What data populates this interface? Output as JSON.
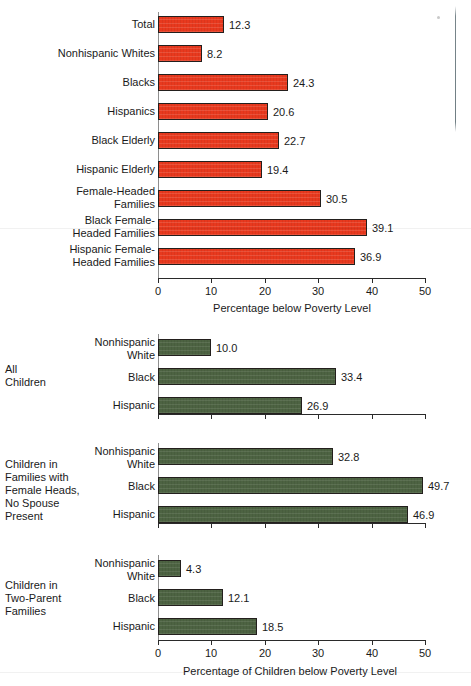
{
  "chart_data": [
    {
      "type": "bar",
      "orientation": "horizontal",
      "id": "poverty-by-group",
      "title": "",
      "xlabel": "Percentage below Poverty Level",
      "ylabel": "",
      "xlim": [
        0,
        50
      ],
      "xticks": [
        "0",
        "10",
        "20",
        "30",
        "40",
        "50"
      ],
      "grid": false,
      "legend": "none",
      "bar_color": "#e8391e",
      "categories": [
        "Total",
        "Nonhispanic Whites",
        "Blacks",
        "Hispanics",
        "Black Elderly",
        "Hispanic Elderly",
        "Female-Headed\nFamilies",
        "Black Female-\nHeaded Families",
        "Hispanic Female-\nHeaded Families"
      ],
      "values": [
        12.3,
        8.2,
        24.3,
        20.6,
        22.7,
        19.4,
        30.5,
        39.1,
        36.9
      ],
      "value_labels": [
        "12.3",
        "8.2",
        "24.3",
        "20.6",
        "22.7",
        "19.4",
        "30.5",
        "39.1",
        "36.9"
      ]
    },
    {
      "type": "bar",
      "orientation": "horizontal",
      "id": "children-poverty-by-family-type",
      "title": "",
      "xlabel": "Percentage of Children below Poverty Level",
      "ylabel": "",
      "xlim": [
        0,
        50
      ],
      "xticks": [
        "0",
        "10",
        "20",
        "30",
        "40",
        "50"
      ],
      "grid": false,
      "legend": "none",
      "bar_color": "#4d6342",
      "groups": [
        {
          "name": "All\nChildren",
          "categories": [
            "Nonhispanic\nWhite",
            "Black",
            "Hispanic"
          ],
          "values": [
            10.0,
            33.4,
            26.9
          ],
          "value_labels": [
            "10.0",
            "33.4",
            "26.9"
          ]
        },
        {
          "name": "Children in\nFamilies with\nFemale Heads,\nNo Spouse\nPresent",
          "categories": [
            "Nonhispanic\nWhite",
            "Black",
            "Hispanic"
          ],
          "values": [
            32.8,
            49.7,
            46.9
          ],
          "value_labels": [
            "32.8",
            "49.7",
            "46.9"
          ]
        },
        {
          "name": "Children in\nTwo-Parent\nFamilies",
          "categories": [
            "Nonhispanic\nWhite",
            "Black",
            "Hispanic"
          ],
          "values": [
            4.3,
            12.1,
            18.5
          ],
          "value_labels": [
            "4.3",
            "12.1",
            "18.5"
          ]
        }
      ]
    }
  ],
  "colors": {
    "bar_red": "#e8391e",
    "bar_green": "#4d6342",
    "bar_outline": "#231f1d",
    "axis": "#2a2a2a",
    "text": "#1a1a1a",
    "background": "#ffffff"
  }
}
